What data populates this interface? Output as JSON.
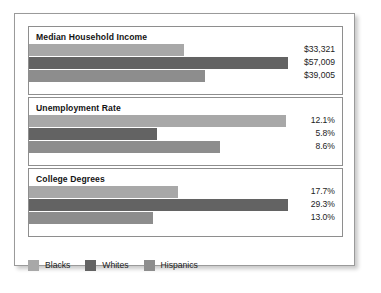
{
  "chart_data": {
    "type": "bar",
    "orientation": "horizontal",
    "title": "",
    "xlabel": "",
    "ylabel": "",
    "grid": false,
    "legend_position": "bottom",
    "categories": [
      "Blacks",
      "Whites",
      "Hispanics"
    ],
    "series_colors": {
      "Blacks": "#a8a8a8",
      "Whites": "#636363",
      "Hispanics": "#8d8d8d"
    },
    "panels": [
      {
        "title": "Median Household Income",
        "unit": "USD",
        "bars": [
          {
            "group": "Blacks",
            "label": "$33,321",
            "value": 33321,
            "bar_pct": 49.5,
            "color": "#a8a8a8"
          },
          {
            "group": "Whites",
            "label": "$57,009",
            "value": 57009,
            "bar_pct": 82.6,
            "color": "#636363"
          },
          {
            "group": "Hispanics",
            "label": "$39,005",
            "value": 39005,
            "bar_pct": 56.2,
            "color": "#8d8d8d"
          }
        ]
      },
      {
        "title": "Unemployment Rate",
        "unit": "percent",
        "bars": [
          {
            "group": "Blacks",
            "label": "12.1%",
            "value": 12.1,
            "bar_pct": 82.2,
            "color": "#a8a8a8"
          },
          {
            "group": "Whites",
            "label": "5.8%",
            "value": 5.8,
            "bar_pct": 41.0,
            "color": "#636363"
          },
          {
            "group": "Hispanics",
            "label": "8.6%",
            "value": 8.6,
            "bar_pct": 61.0,
            "color": "#8d8d8d"
          }
        ]
      },
      {
        "title": "College Degrees",
        "unit": "percent",
        "bars": [
          {
            "group": "Blacks",
            "label": "17.7%",
            "value": 17.7,
            "bar_pct": 47.6,
            "color": "#a8a8a8"
          },
          {
            "group": "Whites",
            "label": "29.3%",
            "value": 29.3,
            "bar_pct": 82.8,
            "color": "#636363"
          },
          {
            "group": "Hispanics",
            "label": "13.0%",
            "value": 13.0,
            "bar_pct": 39.7,
            "color": "#8d8d8d"
          }
        ]
      }
    ],
    "legend": [
      {
        "label": "Blacks",
        "color": "#a8a8a8"
      },
      {
        "label": "Whites",
        "color": "#636363"
      },
      {
        "label": "Hispanics",
        "color": "#8d8d8d"
      }
    ]
  }
}
